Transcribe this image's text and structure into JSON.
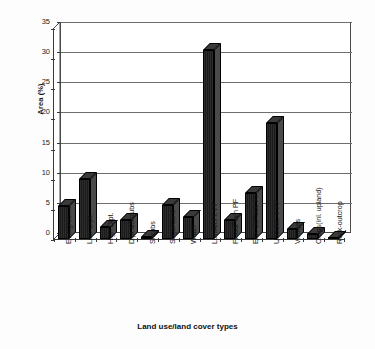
{
  "chart_data": {
    "type": "bar",
    "title": "",
    "xlabel": "Land use/land cover types",
    "ylabel": "Area (%)",
    "ylim": [
      0,
      35
    ],
    "ytick_values": [
      0,
      5,
      10,
      15,
      20,
      25,
      30,
      35
    ],
    "ytick_labels": [
      "0",
      "5",
      "10",
      "15",
      "20",
      "25",
      "30",
      "35"
    ],
    "grid": true,
    "legend": "none",
    "bar_color": "#262626",
    "categories": [
      "Evergreen F",
      "Low Dipt.",
      "High Dipt.",
      "Dipt.&Scrubs",
      "Shrubs",
      "Sugarcane",
      "Water",
      "LowAll.Pl. PF",
      "FloodPlain PF",
      "Ero. Surface PF",
      "Undulat. T PF",
      "Villages",
      "Crops(inl. upland)",
      "Rock-outcrop"
    ],
    "values": [
      5.4,
      10.0,
      2.0,
      3.2,
      0.3,
      5.6,
      3.7,
      31.3,
      3.1,
      7.7,
      19.3,
      1.7,
      0.8,
      0.2
    ]
  }
}
